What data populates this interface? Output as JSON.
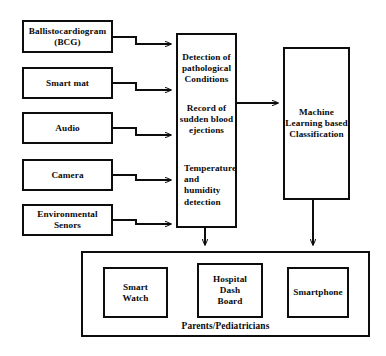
{
  "diagram": {
    "stroke_color": "#0d0d0d",
    "background_color": "#ffffff"
  },
  "inputs": [
    {
      "id": "bcg",
      "label": "Ballistocardiogram (BCG)",
      "line1": "Ballistocardiogram",
      "line2": "(BCG)"
    },
    {
      "id": "smart-mat",
      "label": "Smart mat",
      "line1": "Smart mat",
      "line2": ""
    },
    {
      "id": "audio",
      "label": "Audio",
      "line1": "Audio",
      "line2": ""
    },
    {
      "id": "camera",
      "label": "Camera",
      "line1": "Camera",
      "line2": ""
    },
    {
      "id": "environmental",
      "label": "Environmental Senors",
      "line1": "Environmental",
      "line2": "Senors"
    }
  ],
  "processing": {
    "id": "processing-block",
    "functions": [
      {
        "id": "pathological-detection",
        "text": "Detection of pathological Conditions"
      },
      {
        "id": "blood-ejection-record",
        "text": "Record of sudden blood ejections"
      },
      {
        "id": "temp-humidity",
        "text": "Temperature and humidity detection"
      }
    ]
  },
  "classification": {
    "id": "ml-classification",
    "text": "Machine Learning based Classification"
  },
  "output_group": {
    "id": "parents-pediatricians-group",
    "label": "Parents/Pediatricians",
    "devices": [
      {
        "id": "smart-watch",
        "label": "Smart Watch",
        "line1": "Smart",
        "line2": "Watch",
        "line3": ""
      },
      {
        "id": "hospital-dash",
        "label": "Hospital Dash Board",
        "line1": "Hospital",
        "line2": "Dash",
        "line3": "Board"
      },
      {
        "id": "smartphone",
        "label": "Smartphone",
        "line1": "Smartphone",
        "line2": "",
        "line3": ""
      }
    ]
  }
}
